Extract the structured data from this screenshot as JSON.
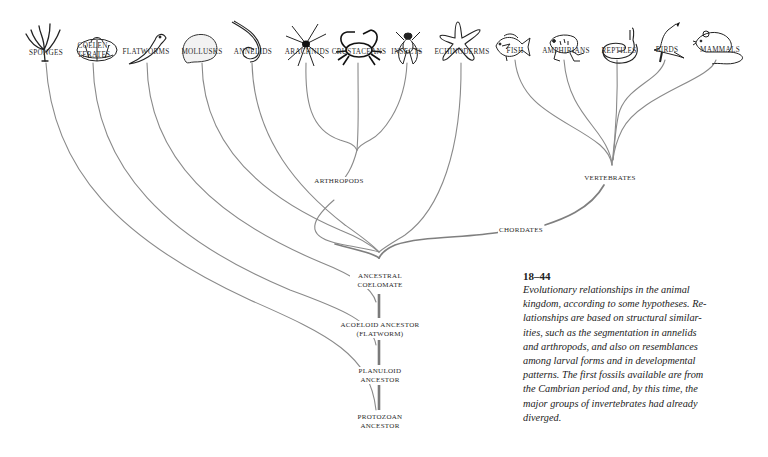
{
  "figure": {
    "number": "18–44",
    "caption_lines": [
      "Evolutionary relationships in the animal",
      "kingdom, according to some hypotheses. Re-",
      "lationships are based on structural similar-",
      "ities, such as the segmentation in annelids",
      "and arthropods, and also on resemblances",
      "among larval forms and in developmental",
      "patterns. The first fossils available are from",
      "the Cambrian period and, by this time, the",
      "major groups of invertebrates had already",
      "diverged."
    ]
  },
  "taxa": [
    {
      "label": "SPONGES",
      "icon": "sponge-icon"
    },
    {
      "label_line1": "COELEN-",
      "label_line2": "TERATES",
      "icon": "coelenterate-icon"
    },
    {
      "label": "FLATWORMS",
      "icon": "flatworm-icon"
    },
    {
      "label": "MOLLUSKS",
      "icon": "mollusk-icon"
    },
    {
      "label": "ANNELIDS",
      "icon": "annelid-icon"
    },
    {
      "label": "ARACHNIDS",
      "icon": "spider-icon"
    },
    {
      "label": "CRUSTACEANS",
      "icon": "crab-icon"
    },
    {
      "label": "INSECTS",
      "icon": "fly-icon"
    },
    {
      "label": "ECHINODERMS",
      "icon": "starfish-icon"
    },
    {
      "label": "FISH",
      "icon": "fish-icon"
    },
    {
      "label": "AMPHIBIANS",
      "icon": "frog-icon"
    },
    {
      "label": "REPTILES",
      "icon": "snake-icon"
    },
    {
      "label": "BIRDS",
      "icon": "bird-icon"
    },
    {
      "label": "MAMMALS",
      "icon": "mouse-icon"
    }
  ],
  "nodes": {
    "arthropods": "ARTHROPODS",
    "vertebrates": "VERTEBRATES",
    "chordates": "CHORDATES",
    "ancestral_coelomate": {
      "line1": "ANCESTRAL",
      "line2": "COELOMATE"
    },
    "acoeloid_ancestor": {
      "line1": "ACOELOID ANCESTOR",
      "line2": "(FLATWORM)"
    },
    "planuloid_ancestor": {
      "line1": "PLANULOID",
      "line2": "ANCESTOR"
    },
    "protozoan_ancestor": {
      "line1": "PROTOZOAN",
      "line2": "ANCESTOR"
    }
  },
  "colors": {
    "branch": "#8a8a8a",
    "trunk": "#7a7a7a",
    "text": "#2a2a2a"
  }
}
